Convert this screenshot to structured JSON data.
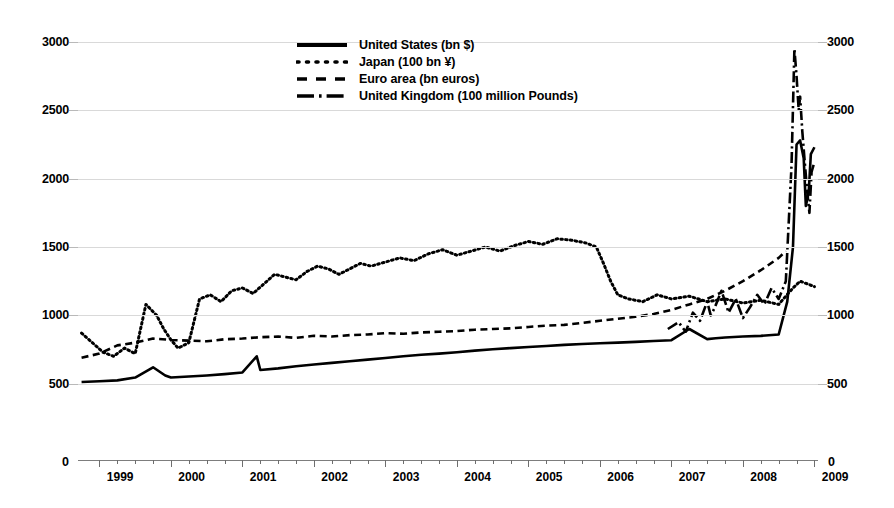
{
  "chart_data": {
    "type": "line",
    "title": "",
    "subtitle": "",
    "xlabel": "",
    "ylabel": "",
    "xlim": [
      1998.7,
      2009.05
    ],
    "ylim": [
      0,
      3000
    ],
    "y_ticks": [
      500,
      1000,
      1500,
      2000,
      2500,
      3000
    ],
    "y_axis_zero_label": "0",
    "dual_axis": true,
    "right_axis_same_as_left": true,
    "grid": "horizontal",
    "legend_position": "top-center",
    "x_tick_labels": [
      "1999",
      "2000",
      "2001",
      "2002",
      "2003",
      "2004",
      "2005",
      "2006",
      "2007",
      "2008",
      "2009"
    ],
    "x_minor_ticks_per_year": 4,
    "series": [
      {
        "name": "United States (bn $)",
        "style": "solid",
        "color": "#000000",
        "x": [
          1998.75,
          1999.0,
          1999.25,
          1999.5,
          1999.75,
          1999.92,
          2000.0,
          2000.25,
          2000.5,
          2000.75,
          2001.0,
          2001.2,
          2001.25,
          2001.5,
          2001.75,
          2002.0,
          2002.25,
          2002.5,
          2002.75,
          2003.0,
          2003.25,
          2003.5,
          2003.75,
          2004.0,
          2004.25,
          2004.5,
          2004.75,
          2005.0,
          2005.25,
          2005.5,
          2005.75,
          2006.0,
          2006.25,
          2006.5,
          2006.75,
          2007.0,
          2007.25,
          2007.5,
          2007.62,
          2007.75,
          2008.0,
          2008.25,
          2008.5,
          2008.62,
          2008.7,
          2008.75,
          2008.8,
          2008.85,
          2008.88,
          2008.92,
          2008.95,
          2009.0
        ],
        "y": [
          512,
          518,
          524,
          545,
          620,
          560,
          545,
          552,
          560,
          570,
          582,
          700,
          600,
          612,
          628,
          640,
          652,
          664,
          676,
          688,
          700,
          712,
          720,
          730,
          742,
          752,
          760,
          768,
          776,
          784,
          790,
          796,
          800,
          806,
          812,
          818,
          900,
          826,
          832,
          838,
          845,
          850,
          860,
          1100,
          1500,
          2250,
          2280,
          2150,
          1800,
          1900,
          2180,
          2230
        ]
      },
      {
        "name": "Japan (100 bn ¥)",
        "style": "dotted",
        "color": "#000000",
        "x": [
          1998.75,
          1998.9,
          1999.05,
          1999.2,
          1999.35,
          1999.5,
          1999.65,
          1999.8,
          1999.9,
          2000.0,
          2000.1,
          2000.25,
          2000.4,
          2000.55,
          2000.7,
          2000.85,
          2001.0,
          2001.15,
          2001.3,
          2001.45,
          2001.6,
          2001.75,
          2001.9,
          2002.05,
          2002.2,
          2002.35,
          2002.5,
          2002.65,
          2002.8,
          2003.0,
          2003.2,
          2003.4,
          2003.6,
          2003.8,
          2004.0,
          2004.2,
          2004.4,
          2004.6,
          2004.8,
          2005.0,
          2005.2,
          2005.4,
          2005.6,
          2005.8,
          2005.95,
          2006.05,
          2006.15,
          2006.25,
          2006.4,
          2006.6,
          2006.8,
          2007.0,
          2007.25,
          2007.5,
          2007.75,
          2008.0,
          2008.25,
          2008.5,
          2008.7,
          2008.8,
          2008.9,
          2009.0
        ],
        "y": [
          870,
          800,
          730,
          700,
          760,
          720,
          1080,
          1000,
          900,
          820,
          760,
          800,
          1120,
          1150,
          1100,
          1180,
          1200,
          1160,
          1230,
          1300,
          1280,
          1260,
          1320,
          1360,
          1340,
          1300,
          1340,
          1380,
          1360,
          1390,
          1420,
          1400,
          1450,
          1480,
          1440,
          1470,
          1500,
          1470,
          1510,
          1540,
          1520,
          1560,
          1550,
          1530,
          1500,
          1380,
          1250,
          1150,
          1120,
          1100,
          1150,
          1120,
          1140,
          1100,
          1120,
          1090,
          1110,
          1080,
          1200,
          1250,
          1230,
          1210
        ]
      },
      {
        "name": "Euro area (bn euros)",
        "style": "dashed",
        "color": "#000000",
        "x": [
          1998.75,
          1999.0,
          1999.25,
          1999.5,
          1999.75,
          2000.0,
          2000.25,
          2000.5,
          2000.75,
          2001.0,
          2001.25,
          2001.5,
          2001.75,
          2002.0,
          2002.25,
          2002.5,
          2002.75,
          2003.0,
          2003.25,
          2003.5,
          2003.75,
          2004.0,
          2004.25,
          2004.5,
          2004.75,
          2005.0,
          2005.25,
          2005.5,
          2005.75,
          2006.0,
          2006.25,
          2006.5,
          2006.75,
          2007.0,
          2007.25,
          2007.5,
          2007.75,
          2008.0,
          2008.25,
          2008.5,
          2008.6
        ],
        "y": [
          690,
          720,
          780,
          800,
          830,
          820,
          815,
          810,
          825,
          830,
          840,
          845,
          835,
          850,
          845,
          855,
          860,
          870,
          865,
          875,
          880,
          885,
          895,
          900,
          905,
          915,
          925,
          930,
          945,
          960,
          975,
          990,
          1010,
          1040,
          1080,
          1120,
          1180,
          1250,
          1330,
          1420,
          1470
        ]
      },
      {
        "name": "United Kingdom (100 million Pounds)",
        "style": "dashdot",
        "color": "#000000",
        "x": [
          2006.95,
          2007.1,
          2007.2,
          2007.3,
          2007.4,
          2007.5,
          2007.55,
          2007.6,
          2007.7,
          2007.8,
          2007.9,
          2008.0,
          2008.1,
          2008.2,
          2008.3,
          2008.4,
          2008.5,
          2008.6,
          2008.68,
          2008.72,
          2008.75,
          2008.78,
          2008.8,
          2008.83,
          2008.86,
          2008.9,
          2008.93,
          2008.96,
          2009.0
        ],
        "y": [
          900,
          950,
          880,
          1020,
          960,
          1100,
          1000,
          1050,
          1180,
          1020,
          1120,
          980,
          1060,
          1150,
          1080,
          1200,
          1120,
          1250,
          2100,
          2950,
          2750,
          2500,
          2600,
          2350,
          2150,
          1900,
          1750,
          2050,
          2120
        ]
      }
    ],
    "annotations": []
  },
  "legend": {
    "items": [
      {
        "label": "United States (bn $)",
        "style": "solid"
      },
      {
        "label": "Japan (100 bn ¥)",
        "style": "dotted"
      },
      {
        "label": "Euro area (bn euros)",
        "style": "dashed"
      },
      {
        "label": "United Kingdom (100 million Pounds)",
        "style": "dashdot"
      }
    ]
  },
  "axes": {
    "left_zero": "0",
    "right_zero": "0"
  }
}
